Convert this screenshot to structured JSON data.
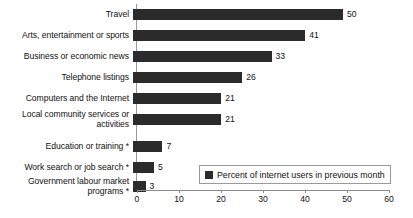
{
  "chart_data": {
    "type": "bar",
    "orientation": "horizontal",
    "title": "",
    "xlabel": "",
    "ylabel": "",
    "xlim": [
      0,
      60
    ],
    "xticks": [
      0,
      10,
      20,
      30,
      40,
      50,
      60
    ],
    "grid": false,
    "legend_position": "bottom-right",
    "bar_color": "#2b2b2b",
    "categories": [
      "Travel",
      "Arts, entertainment or sports",
      "Business or economic news",
      "Telephone listings",
      "Computers and the Internet",
      "Local community services or\nactivities",
      "Education or training *",
      "Work search or job search *",
      "Government labour market\nprograms *"
    ],
    "values": [
      50,
      41,
      33,
      26,
      21,
      21,
      7,
      5,
      3
    ],
    "value_labels": [
      "50",
      "41",
      "33",
      "26",
      "21",
      "21",
      "7",
      "5",
      "3"
    ],
    "series": [
      {
        "name": "Percent of internet users in previous month",
        "values": [
          50,
          41,
          33,
          26,
          21,
          21,
          7,
          5,
          3
        ]
      }
    ],
    "legend": [
      "Percent of internet users in previous month"
    ]
  },
  "legend": {
    "label": "Percent of internet users in previous month"
  },
  "axis": {
    "tick_labels": [
      "0",
      "10",
      "20",
      "30",
      "40",
      "50",
      "60"
    ]
  }
}
